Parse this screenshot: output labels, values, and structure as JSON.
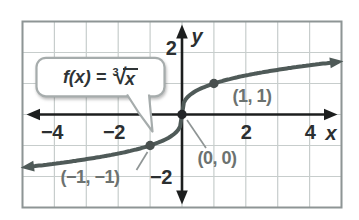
{
  "chart_data": {
    "type": "line",
    "function_label": {
      "prefix": "f(x) = ",
      "root_index": "3",
      "radical_symbol": "√",
      "radicand": "x"
    },
    "x_axis_label": "x",
    "y_axis_label": "y",
    "x_range": [
      -5,
      5
    ],
    "y_range": [
      -3,
      3
    ],
    "grid": true,
    "x_ticks": [
      {
        "value": -4,
        "label": "−4"
      },
      {
        "value": -2,
        "label": "−2"
      },
      {
        "value": 2,
        "label": "2"
      },
      {
        "value": 4,
        "label": "4"
      }
    ],
    "y_ticks": [
      {
        "value": 2,
        "label": "2"
      },
      {
        "value": -2,
        "label": "−2"
      }
    ],
    "curve": {
      "expr": "cbrt(x)",
      "x_min": -4.78,
      "x_max": 4.78,
      "arrows": "both"
    },
    "points": [
      {
        "x": 1,
        "y": 1,
        "label": "(1, 1)"
      },
      {
        "x": 0,
        "y": 0,
        "label": "(0, 0)"
      },
      {
        "x": -1,
        "y": -1,
        "label": "(−1, −1)"
      }
    ],
    "colors": {
      "curve": "#4f5a58",
      "point": "#49504f",
      "origin_point": "#242628",
      "axis": "#1c1e1e",
      "grid": "#c7cdcc",
      "frame": "#8e9595",
      "tick_text": "#2b2f31",
      "label_gray": "#6c7270",
      "leader": "#8f9595",
      "callout_border": "#a6acac",
      "callout_fill": "#ffffff",
      "callout_text": "#2f3436",
      "background": "#ffffff"
    }
  }
}
